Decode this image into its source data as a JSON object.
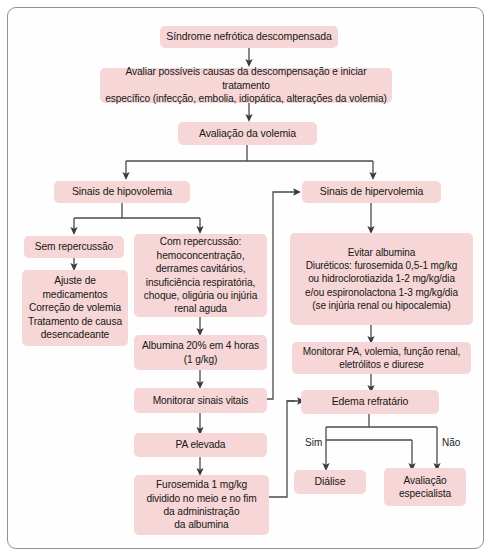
{
  "diagram": {
    "title_text": "Síndrome nefrótica descompensada",
    "box_color": "#f6d6d6",
    "line_color": "#4a4a4a",
    "border_color": "#8d9296",
    "type": "flowchart",
    "language": "pt-BR"
  },
  "nodes": {
    "sindrome": "Síndrome nefrótica descompensada",
    "avaliar_causas": "Avaliar possíveis causas da descompensação e iniciar tratamento\nespecífico (infecção, embolia, idiopática, alterações da volemia)",
    "avaliacao_volemia": "Avaliação da volemia",
    "sinais_hipovolemia": "Sinais de hipovolemia",
    "sinais_hipervolemia": "Sinais de hipervolemia",
    "sem_repercussao": "Sem repercussão",
    "ajuste": "Ajuste de\nmedicamentos\nCorreção de volemia\nTratamento de causa\ndesencadeante",
    "com_repercussao": "Com repercussão:\nhemoconcentração,\nderrames cavitários,\ninsuficiência respiratória,\nchoque, oligúria ou injúria\nrenal aguda",
    "albumina": "Albumina 20% em 4 horas\n(1 g/kg)",
    "monitorar_sinais": "Monitorar sinais vitais",
    "pa_elevada": "PA elevada",
    "furosemida": "Furosemida 1 mg/kg\ndividido no meio e no fim\nda administração\nda albumina",
    "evitar_albumina": "Evitar albumina\nDiuréticos: furosemida 0,5-1 mg/kg\nou hidroclorotiazida 1-2 mg/kg/dia\ne/ou espironolactona 1-3 mg/kg/dia\n(se injúria renal ou hipocalemia)",
    "monitorar_pa": "Monitorar PA, volemia, função renal,\neletrólitos e diurese",
    "edema_refratario": "Edema refratário",
    "dialise": "Diálise",
    "avaliacao_especialista": "Avaliação\nespecialista"
  },
  "edge_labels": {
    "sim": "Sim",
    "nao": "Não"
  }
}
